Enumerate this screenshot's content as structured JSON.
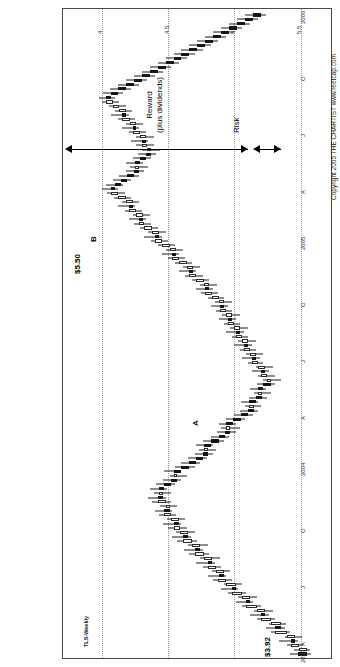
{
  "figure": {
    "title": "Figure 8.6: Seeing the pattern in real time",
    "copyright": "Copyright 2005 THE CHARTIST   www.reefcap.com"
  },
  "chart_data": {
    "type": "candlestick",
    "series_name": "TLS-Weekly",
    "title": "Figure 8.6: Seeing the pattern in real time",
    "xlabel": "",
    "ylabel": "",
    "ylim": [
      3.8,
      5.75
    ],
    "grid": true,
    "legend_position": "none",
    "y_ticks": [
      4,
      4.5,
      5,
      5.5
    ],
    "y_tick_labels": [
      "4",
      "4.5",
      "5",
      "5.5"
    ],
    "x_tick_labels": [
      "2003",
      "A",
      "J",
      "O",
      "2004",
      "A",
      "J",
      "O",
      "2005",
      "A",
      "J",
      "O",
      "2006"
    ],
    "x_tick_positions": [
      0,
      4,
      17,
      30,
      43,
      56,
      69,
      82,
      95,
      108,
      121,
      134,
      147
    ],
    "annotations": {
      "price_high": "$5.50",
      "price_low": "$3.92",
      "marker_a": "A",
      "marker_b": "B",
      "reward_line1": "Reward",
      "reward_line2": "(plus dividends)",
      "risk": "Risk"
    },
    "bars": [
      {
        "i": 0,
        "o": 4.02,
        "h": 4.08,
        "l": 3.92,
        "c": 3.95
      },
      {
        "i": 1,
        "o": 3.95,
        "h": 4.05,
        "l": 3.93,
        "c": 4.01
      },
      {
        "i": 2,
        "o": 4.01,
        "h": 4.1,
        "l": 3.98,
        "c": 4.07
      },
      {
        "i": 3,
        "o": 4.07,
        "h": 4.16,
        "l": 4.02,
        "c": 4.04
      },
      {
        "i": 4,
        "o": 4.04,
        "h": 4.12,
        "l": 3.99,
        "c": 4.1
      },
      {
        "i": 5,
        "o": 4.1,
        "h": 4.22,
        "l": 4.08,
        "c": 4.19
      },
      {
        "i": 6,
        "o": 4.19,
        "h": 4.26,
        "l": 4.12,
        "c": 4.15
      },
      {
        "i": 7,
        "o": 4.15,
        "h": 4.24,
        "l": 4.11,
        "c": 4.22
      },
      {
        "i": 8,
        "o": 4.22,
        "h": 4.33,
        "l": 4.19,
        "c": 4.3
      },
      {
        "i": 9,
        "o": 4.3,
        "h": 4.38,
        "l": 4.24,
        "c": 4.27
      },
      {
        "i": 10,
        "o": 4.27,
        "h": 4.35,
        "l": 4.21,
        "c": 4.33
      },
      {
        "i": 11,
        "o": 4.33,
        "h": 4.44,
        "l": 4.3,
        "c": 4.41
      },
      {
        "i": 12,
        "o": 4.41,
        "h": 4.49,
        "l": 4.36,
        "c": 4.38
      },
      {
        "i": 13,
        "o": 4.38,
        "h": 4.47,
        "l": 4.33,
        "c": 4.44
      },
      {
        "i": 14,
        "o": 4.44,
        "h": 4.55,
        "l": 4.41,
        "c": 4.52
      },
      {
        "i": 15,
        "o": 4.52,
        "h": 4.6,
        "l": 4.47,
        "c": 4.49
      },
      {
        "i": 16,
        "o": 4.49,
        "h": 4.58,
        "l": 4.44,
        "c": 4.56
      },
      {
        "i": 17,
        "o": 4.56,
        "h": 4.66,
        "l": 4.52,
        "c": 4.62
      },
      {
        "i": 18,
        "o": 4.62,
        "h": 4.7,
        "l": 4.56,
        "c": 4.58
      },
      {
        "i": 19,
        "o": 4.58,
        "h": 4.67,
        "l": 4.53,
        "c": 4.64
      },
      {
        "i": 20,
        "o": 4.64,
        "h": 4.74,
        "l": 4.6,
        "c": 4.7
      },
      {
        "i": 21,
        "o": 4.7,
        "h": 4.79,
        "l": 4.65,
        "c": 4.67
      },
      {
        "i": 22,
        "o": 4.67,
        "h": 4.76,
        "l": 4.61,
        "c": 4.73
      },
      {
        "i": 23,
        "o": 4.73,
        "h": 4.84,
        "l": 4.69,
        "c": 4.8
      },
      {
        "i": 24,
        "o": 4.8,
        "h": 4.88,
        "l": 4.74,
        "c": 4.76
      },
      {
        "i": 25,
        "o": 4.76,
        "h": 4.85,
        "l": 4.7,
        "c": 4.82
      },
      {
        "i": 26,
        "o": 4.82,
        "h": 4.93,
        "l": 4.78,
        "c": 4.89
      },
      {
        "i": 27,
        "o": 4.89,
        "h": 4.97,
        "l": 4.83,
        "c": 4.85
      },
      {
        "i": 28,
        "o": 4.85,
        "h": 4.94,
        "l": 4.8,
        "c": 4.91
      },
      {
        "i": 29,
        "o": 4.91,
        "h": 5.0,
        "l": 4.86,
        "c": 4.96
      },
      {
        "i": 30,
        "o": 4.96,
        "h": 5.04,
        "l": 4.9,
        "c": 4.92
      },
      {
        "i": 31,
        "o": 4.92,
        "h": 5.01,
        "l": 4.87,
        "c": 4.98
      },
      {
        "i": 32,
        "o": 4.98,
        "h": 5.07,
        "l": 4.94,
        "c": 5.03
      },
      {
        "i": 33,
        "o": 5.03,
        "h": 5.1,
        "l": 4.97,
        "c": 4.99
      },
      {
        "i": 34,
        "o": 4.99,
        "h": 5.06,
        "l": 4.93,
        "c": 5.02
      },
      {
        "i": 35,
        "o": 5.02,
        "h": 5.12,
        "l": 4.98,
        "c": 5.08
      },
      {
        "i": 36,
        "o": 5.08,
        "h": 5.15,
        "l": 5.02,
        "c": 5.04
      },
      {
        "i": 37,
        "o": 5.04,
        "h": 5.11,
        "l": 4.98,
        "c": 5.07
      },
      {
        "i": 38,
        "o": 5.07,
        "h": 5.14,
        "l": 5.01,
        "c": 5.03
      },
      {
        "i": 39,
        "o": 5.03,
        "h": 5.09,
        "l": 4.95,
        "c": 4.98
      },
      {
        "i": 40,
        "o": 4.98,
        "h": 5.04,
        "l": 4.9,
        "c": 4.93
      },
      {
        "i": 41,
        "o": 4.93,
        "h": 4.99,
        "l": 4.86,
        "c": 4.96
      },
      {
        "i": 42,
        "o": 4.96,
        "h": 5.03,
        "l": 4.91,
        "c": 4.9
      },
      {
        "i": 43,
        "o": 4.9,
        "h": 4.95,
        "l": 4.8,
        "c": 4.84
      },
      {
        "i": 44,
        "o": 4.84,
        "h": 4.9,
        "l": 4.76,
        "c": 4.79
      },
      {
        "i": 45,
        "o": 4.79,
        "h": 4.85,
        "l": 4.71,
        "c": 4.74
      },
      {
        "i": 46,
        "o": 4.74,
        "h": 4.8,
        "l": 4.66,
        "c": 4.7
      },
      {
        "i": 47,
        "o": 4.7,
        "h": 4.77,
        "l": 4.64,
        "c": 4.73
      },
      {
        "i": 48,
        "o": 4.73,
        "h": 4.79,
        "l": 4.66,
        "c": 4.68
      },
      {
        "i": 49,
        "o": 4.68,
        "h": 4.74,
        "l": 4.58,
        "c": 4.62
      },
      {
        "i": 50,
        "o": 4.62,
        "h": 4.68,
        "l": 4.54,
        "c": 4.57
      },
      {
        "i": 51,
        "o": 4.57,
        "h": 4.63,
        "l": 4.49,
        "c": 4.53
      },
      {
        "i": 52,
        "o": 4.53,
        "h": 4.6,
        "l": 4.46,
        "c": 4.56
      },
      {
        "i": 53,
        "o": 4.56,
        "h": 4.62,
        "l": 4.49,
        "c": 4.51
      },
      {
        "i": 54,
        "o": 4.51,
        "h": 4.56,
        "l": 4.42,
        "c": 4.45
      },
      {
        "i": 55,
        "o": 4.45,
        "h": 4.5,
        "l": 4.36,
        "c": 4.4
      },
      {
        "i": 56,
        "o": 4.4,
        "h": 4.46,
        "l": 4.32,
        "c": 4.35
      },
      {
        "i": 57,
        "o": 4.35,
        "h": 4.42,
        "l": 4.3,
        "c": 4.39
      },
      {
        "i": 58,
        "o": 4.39,
        "h": 4.45,
        "l": 4.32,
        "c": 4.34
      },
      {
        "i": 59,
        "o": 4.34,
        "h": 4.39,
        "l": 4.25,
        "c": 4.29
      },
      {
        "i": 60,
        "o": 4.29,
        "h": 4.35,
        "l": 4.22,
        "c": 4.32
      },
      {
        "i": 61,
        "o": 4.32,
        "h": 4.38,
        "l": 4.26,
        "c": 4.28
      },
      {
        "i": 62,
        "o": 4.28,
        "h": 4.33,
        "l": 4.19,
        "c": 4.22
      },
      {
        "i": 63,
        "o": 4.22,
        "h": 4.28,
        "l": 4.15,
        "c": 4.25
      },
      {
        "i": 64,
        "o": 4.25,
        "h": 4.32,
        "l": 4.19,
        "c": 4.3
      },
      {
        "i": 65,
        "o": 4.3,
        "h": 4.37,
        "l": 4.24,
        "c": 4.27
      },
      {
        "i": 66,
        "o": 4.27,
        "h": 4.34,
        "l": 4.21,
        "c": 4.32
      },
      {
        "i": 67,
        "o": 4.32,
        "h": 4.4,
        "l": 4.28,
        "c": 4.37
      },
      {
        "i": 68,
        "o": 4.37,
        "h": 4.44,
        "l": 4.31,
        "c": 4.34
      },
      {
        "i": 69,
        "o": 4.34,
        "h": 4.41,
        "l": 4.28,
        "c": 4.38
      },
      {
        "i": 70,
        "o": 4.38,
        "h": 4.46,
        "l": 4.34,
        "c": 4.43
      },
      {
        "i": 71,
        "o": 4.43,
        "h": 4.5,
        "l": 4.37,
        "c": 4.4
      },
      {
        "i": 72,
        "o": 4.4,
        "h": 4.47,
        "l": 4.34,
        "c": 4.44
      },
      {
        "i": 73,
        "o": 4.44,
        "h": 4.52,
        "l": 4.4,
        "c": 4.49
      },
      {
        "i": 74,
        "o": 4.49,
        "h": 4.56,
        "l": 4.43,
        "c": 4.46
      },
      {
        "i": 75,
        "o": 4.46,
        "h": 4.53,
        "l": 4.4,
        "c": 4.5
      },
      {
        "i": 76,
        "o": 4.5,
        "h": 4.58,
        "l": 4.46,
        "c": 4.55
      },
      {
        "i": 77,
        "o": 4.55,
        "h": 4.62,
        "l": 4.49,
        "c": 4.52
      },
      {
        "i": 78,
        "o": 4.52,
        "h": 4.59,
        "l": 4.46,
        "c": 4.56
      },
      {
        "i": 79,
        "o": 4.56,
        "h": 4.64,
        "l": 4.52,
        "c": 4.61
      },
      {
        "i": 80,
        "o": 4.61,
        "h": 4.68,
        "l": 4.55,
        "c": 4.58
      },
      {
        "i": 81,
        "o": 4.58,
        "h": 4.65,
        "l": 4.52,
        "c": 4.62
      },
      {
        "i": 82,
        "o": 4.62,
        "h": 4.7,
        "l": 4.58,
        "c": 4.67
      },
      {
        "i": 83,
        "o": 4.67,
        "h": 4.75,
        "l": 4.62,
        "c": 4.72
      },
      {
        "i": 84,
        "o": 4.72,
        "h": 4.79,
        "l": 4.66,
        "c": 4.69
      },
      {
        "i": 85,
        "o": 4.69,
        "h": 4.76,
        "l": 4.63,
        "c": 4.73
      },
      {
        "i": 86,
        "o": 4.73,
        "h": 4.82,
        "l": 4.69,
        "c": 4.79
      },
      {
        "i": 87,
        "o": 4.79,
        "h": 4.87,
        "l": 4.74,
        "c": 4.84
      },
      {
        "i": 88,
        "o": 4.84,
        "h": 4.92,
        "l": 4.79,
        "c": 4.81
      },
      {
        "i": 89,
        "o": 4.81,
        "h": 4.89,
        "l": 4.76,
        "c": 4.86
      },
      {
        "i": 90,
        "o": 4.86,
        "h": 4.95,
        "l": 4.82,
        "c": 4.92
      },
      {
        "i": 91,
        "o": 4.92,
        "h": 5.0,
        "l": 4.87,
        "c": 4.97
      },
      {
        "i": 92,
        "o": 4.97,
        "h": 5.05,
        "l": 4.92,
        "c": 4.94
      },
      {
        "i": 93,
        "o": 4.94,
        "h": 5.02,
        "l": 4.89,
        "c": 4.99
      },
      {
        "i": 94,
        "o": 4.99,
        "h": 5.08,
        "l": 4.95,
        "c": 5.05
      },
      {
        "i": 95,
        "o": 5.05,
        "h": 5.13,
        "l": 5.0,
        "c": 5.1
      },
      {
        "i": 96,
        "o": 5.1,
        "h": 5.18,
        "l": 5.05,
        "c": 5.07
      },
      {
        "i": 97,
        "o": 5.07,
        "h": 5.15,
        "l": 5.02,
        "c": 5.12
      },
      {
        "i": 98,
        "o": 5.12,
        "h": 5.21,
        "l": 5.08,
        "c": 5.18
      },
      {
        "i": 99,
        "o": 5.18,
        "h": 5.26,
        "l": 5.13,
        "c": 5.22
      },
      {
        "i": 100,
        "o": 5.22,
        "h": 5.3,
        "l": 5.17,
        "c": 5.19
      },
      {
        "i": 101,
        "o": 5.19,
        "h": 5.27,
        "l": 5.14,
        "c": 5.24
      },
      {
        "i": 102,
        "o": 5.24,
        "h": 5.33,
        "l": 5.2,
        "c": 5.3
      },
      {
        "i": 103,
        "o": 5.3,
        "h": 5.38,
        "l": 5.25,
        "c": 5.27
      },
      {
        "i": 104,
        "o": 5.27,
        "h": 5.35,
        "l": 5.22,
        "c": 5.32
      },
      {
        "i": 105,
        "o": 5.32,
        "h": 5.41,
        "l": 5.28,
        "c": 5.38
      },
      {
        "i": 106,
        "o": 5.38,
        "h": 5.46,
        "l": 5.33,
        "c": 5.43
      },
      {
        "i": 107,
        "o": 5.43,
        "h": 5.5,
        "l": 5.38,
        "c": 5.4
      },
      {
        "i": 108,
        "o": 5.4,
        "h": 5.47,
        "l": 5.34,
        "c": 5.36
      },
      {
        "i": 109,
        "o": 5.36,
        "h": 5.42,
        "l": 5.28,
        "c": 5.31
      },
      {
        "i": 110,
        "o": 5.31,
        "h": 5.37,
        "l": 5.22,
        "c": 5.26
      },
      {
        "i": 111,
        "o": 5.26,
        "h": 5.32,
        "l": 5.18,
        "c": 5.22
      },
      {
        "i": 112,
        "o": 5.22,
        "h": 5.29,
        "l": 5.15,
        "c": 5.25
      },
      {
        "i": 113,
        "o": 5.25,
        "h": 5.32,
        "l": 5.19,
        "c": 5.21
      },
      {
        "i": 114,
        "o": 5.21,
        "h": 5.27,
        "l": 5.13,
        "c": 5.17
      },
      {
        "i": 115,
        "o": 5.17,
        "h": 5.23,
        "l": 5.09,
        "c": 5.13
      },
      {
        "i": 116,
        "o": 5.13,
        "h": 5.2,
        "l": 5.06,
        "c": 5.16
      },
      {
        "i": 117,
        "o": 5.16,
        "h": 5.24,
        "l": 5.11,
        "c": 5.2
      },
      {
        "i": 118,
        "o": 5.2,
        "h": 5.28,
        "l": 5.15,
        "c": 5.17
      },
      {
        "i": 119,
        "o": 5.17,
        "h": 5.24,
        "l": 5.11,
        "c": 5.21
      },
      {
        "i": 120,
        "o": 5.21,
        "h": 5.3,
        "l": 5.17,
        "c": 5.27
      },
      {
        "i": 121,
        "o": 5.27,
        "h": 5.35,
        "l": 5.22,
        "c": 5.24
      },
      {
        "i": 122,
        "o": 5.24,
        "h": 5.32,
        "l": 5.19,
        "c": 5.29
      },
      {
        "i": 123,
        "o": 5.29,
        "h": 5.38,
        "l": 5.25,
        "c": 5.35
      },
      {
        "i": 124,
        "o": 5.35,
        "h": 5.43,
        "l": 5.3,
        "c": 5.32
      },
      {
        "i": 125,
        "o": 5.32,
        "h": 5.4,
        "l": 5.27,
        "c": 5.37
      },
      {
        "i": 126,
        "o": 5.37,
        "h": 5.45,
        "l": 5.32,
        "c": 5.42
      },
      {
        "i": 127,
        "o": 5.42,
        "h": 5.5,
        "l": 5.37,
        "c": 5.47
      },
      {
        "i": 128,
        "o": 5.47,
        "h": 5.52,
        "l": 5.4,
        "c": 5.43
      },
      {
        "i": 129,
        "o": 5.43,
        "h": 5.49,
        "l": 5.34,
        "c": 5.38
      },
      {
        "i": 130,
        "o": 5.38,
        "h": 5.44,
        "l": 5.28,
        "c": 5.32
      },
      {
        "i": 131,
        "o": 5.32,
        "h": 5.38,
        "l": 5.22,
        "c": 5.26
      },
      {
        "i": 132,
        "o": 5.26,
        "h": 5.32,
        "l": 5.16,
        "c": 5.2
      },
      {
        "i": 133,
        "o": 5.2,
        "h": 5.26,
        "l": 5.1,
        "c": 5.14
      },
      {
        "i": 134,
        "o": 5.14,
        "h": 5.2,
        "l": 5.04,
        "c": 5.08
      },
      {
        "i": 135,
        "o": 5.08,
        "h": 5.14,
        "l": 4.98,
        "c": 5.02
      },
      {
        "i": 136,
        "o": 5.02,
        "h": 5.08,
        "l": 4.92,
        "c": 4.96
      },
      {
        "i": 137,
        "o": 4.96,
        "h": 5.02,
        "l": 4.86,
        "c": 4.9
      },
      {
        "i": 138,
        "o": 4.9,
        "h": 4.96,
        "l": 4.8,
        "c": 4.84
      },
      {
        "i": 139,
        "o": 4.84,
        "h": 4.9,
        "l": 4.74,
        "c": 4.78
      },
      {
        "i": 140,
        "o": 4.78,
        "h": 4.84,
        "l": 4.68,
        "c": 4.72
      },
      {
        "i": 141,
        "o": 4.72,
        "h": 4.78,
        "l": 4.62,
        "c": 4.66
      },
      {
        "i": 142,
        "o": 4.66,
        "h": 4.72,
        "l": 4.56,
        "c": 4.6
      },
      {
        "i": 143,
        "o": 4.6,
        "h": 4.66,
        "l": 4.5,
        "c": 4.54
      },
      {
        "i": 144,
        "o": 4.54,
        "h": 4.6,
        "l": 4.44,
        "c": 4.48
      },
      {
        "i": 145,
        "o": 4.48,
        "h": 4.54,
        "l": 4.38,
        "c": 4.42
      },
      {
        "i": 146,
        "o": 4.42,
        "h": 4.48,
        "l": 4.32,
        "c": 4.36
      },
      {
        "i": 147,
        "o": 4.36,
        "h": 4.42,
        "l": 4.26,
        "c": 4.3
      }
    ]
  }
}
